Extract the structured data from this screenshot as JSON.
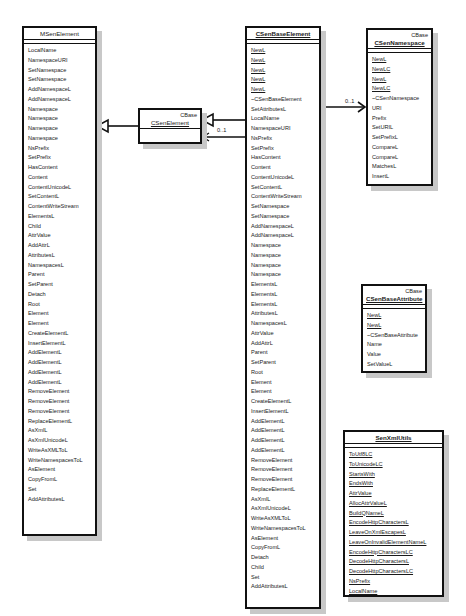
{
  "classes": {
    "msen_element": {
      "name": "MSenElement",
      "operations": [
        "LocalName",
        "NamespaceURI",
        "SetNamespace",
        "SetNamespace",
        "AddNamespaceL",
        "AddNamespaceL",
        "Namespace",
        "Namespace",
        "Namespace",
        "Namespace",
        "NsPrefix",
        "SetPrefix",
        "HasContent",
        "Content",
        "ContentUnicodeL",
        "SetContentL",
        "ContentWriteStream",
        "ElementsL",
        "Child",
        "AttrValue",
        "AddAttrL",
        "AttributesL",
        "NamespacesL",
        "Parent",
        "SetParent",
        "Detach",
        "Root",
        "Element",
        "Element",
        "CreateElementL",
        "InsertElementL",
        "AddElementL",
        "AddElementL",
        "AddElementL",
        "AddElementL",
        "RemoveElement",
        "RemoveElement",
        "RemoveElement",
        "ReplaceElementL",
        "AsXmlL",
        "AsXmlUnicodeL",
        "WriteAsXMLToL",
        "WriteNamespacesToL",
        "AsElement",
        "CopyFromL",
        "Set",
        "AddAttributesL"
      ]
    },
    "csen_element": {
      "stereotype": "CBase",
      "name": "CSenElement"
    },
    "csen_base_element": {
      "name": "CSenBaseElement",
      "static_operations": [
        "NewL",
        "NewL",
        "NewL",
        "NewL",
        "NewL"
      ],
      "operations": [
        "~CSenBaseElement",
        "SetAttributesL",
        "LocalName",
        "NamespaceURI",
        "NsPrefix",
        "SetPrefix",
        "HasContent",
        "Content",
        "ContentUnicodeL",
        "SetContentL",
        "ContentWriteStream",
        "SetNamespace",
        "SetNamespace",
        "AddNamespaceL",
        "AddNamespaceL",
        "Namespace",
        "Namespace",
        "Namespace",
        "Namespace",
        "ElementsL",
        "ElementsL",
        "ElementsL",
        "AttributesL",
        "NamespacesL",
        "AttrValue",
        "AddAttrL",
        "Parent",
        "SetParent",
        "Root",
        "Element",
        "Element",
        "CreateElementL",
        "InsertElementL",
        "AddElementL",
        "AddElementL",
        "AddElementL",
        "AddElementL",
        "RemoveElement",
        "RemoveElement",
        "RemoveElement",
        "ReplaceElementL",
        "AsXmlL",
        "AsXmlUnicodeL",
        "WriteAsXMLToL",
        "WriteNamespacesToL",
        "AsElement",
        "CopyFromL",
        "Detach",
        "Child",
        "Set",
        "AddAttributesL"
      ]
    },
    "csen_namespace": {
      "stereotype": "CBase",
      "name": "CSenNamespace",
      "static_operations": [
        "NewL",
        "NewLC",
        "NewL",
        "NewLC"
      ],
      "operations": [
        "~CSenNamespace",
        "URI",
        "Prefix",
        "SetURIL",
        "SetPrefixL",
        "CompareL",
        "CompareL",
        "MatchesL",
        "InsertL"
      ]
    },
    "csen_base_attribute": {
      "stereotype": "CBase",
      "name": "CSenBaseAttribute",
      "static_operations": [
        "NewL",
        "NewL"
      ],
      "operations": [
        "~CSenBaseAttribute",
        "Name",
        "Value",
        "SetValueL"
      ]
    },
    "sen_xml_utils": {
      "name": "SenXmlUtils",
      "static_operations": [
        "ToUtf8LC",
        "ToUnicodeLC",
        "StartsWith",
        "EndsWith",
        "AttrValue",
        "AllocAttrValueL",
        "BuildQNameL",
        "EncodeHttpCharactersL",
        "LeaveOnXmlEscapesL",
        "LeaveOnInvalidElementNameL",
        "EncodeHttpCharactersLC",
        "DecodeHttpCharactersL",
        "DecodeHttpCharactersLC",
        "NsPrefix",
        "LocalName"
      ]
    }
  },
  "relations": {
    "base_to_element_multiplicity": "0..1",
    "base_to_namespace_multiplicity": "0..1"
  }
}
